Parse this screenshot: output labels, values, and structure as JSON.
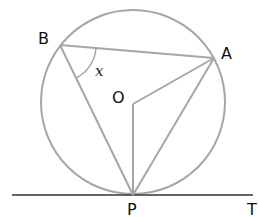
{
  "diagram": {
    "colors": {
      "line": "#a6a6a6",
      "text": "#111111",
      "background": "#ffffff"
    },
    "circle": {
      "cx": 133,
      "cy": 102,
      "r": 92
    },
    "points": {
      "B": {
        "x": 60,
        "y": 45,
        "label": "B"
      },
      "A": {
        "x": 214,
        "y": 58,
        "label": "A"
      },
      "O": {
        "x": 133,
        "y": 104,
        "label": "O"
      },
      "P": {
        "x": 133,
        "y": 195,
        "label": "P"
      },
      "T": {
        "x": 253,
        "y": 195,
        "label": "T"
      }
    },
    "segments": [
      {
        "from": "B",
        "to": "A"
      },
      {
        "from": "B",
        "to": "P"
      },
      {
        "from": "O",
        "to": "A"
      },
      {
        "from": "O",
        "to": "P"
      },
      {
        "from": "A",
        "to": "P"
      }
    ],
    "tangent_line": {
      "x1": 12,
      "y1": 195,
      "x2": 253,
      "y2": 195,
      "label": "T"
    },
    "angle_marker": {
      "vertex": "B",
      "label": "x"
    }
  }
}
